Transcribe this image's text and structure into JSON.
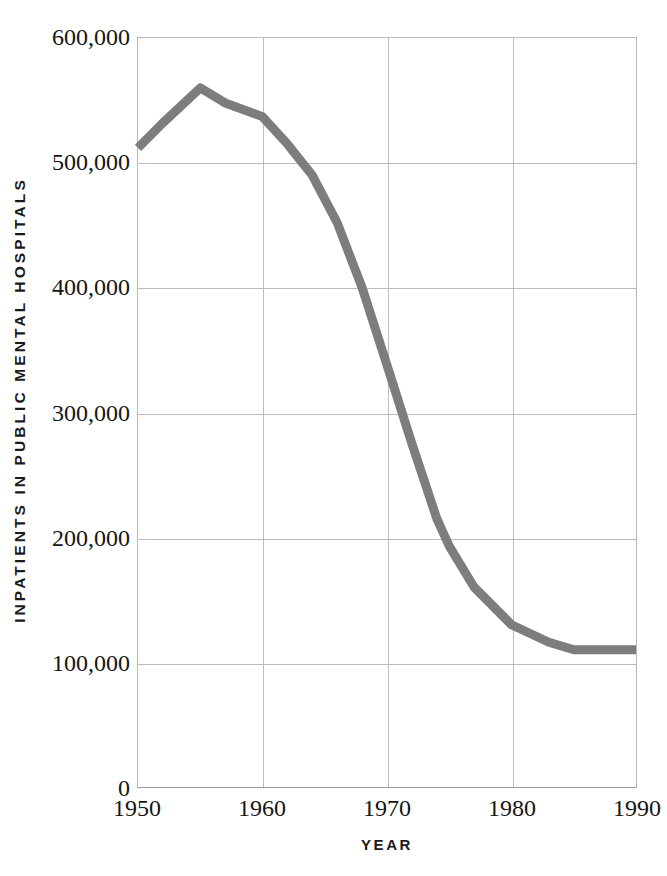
{
  "chart_data": {
    "type": "line",
    "title": "",
    "xlabel": "YEAR",
    "ylabel": "INPATIENTS IN PUBLIC MENTAL HOSPITALS",
    "xlim": [
      1950,
      1990
    ],
    "ylim": [
      0,
      600000
    ],
    "grid": true,
    "legend": false,
    "line_color": "#7d7d7d",
    "line_width": 9,
    "gridline_color": "#bcbcbc",
    "axis_color": "#9a9a9a",
    "background": "#ffffff",
    "x_ticks": [
      1950,
      1960,
      1970,
      1980,
      1990
    ],
    "x_tick_labels": [
      "1950",
      "1960",
      "1970",
      "1980",
      "1990"
    ],
    "y_ticks": [
      0,
      100000,
      200000,
      300000,
      400000,
      500000,
      600000
    ],
    "y_tick_labels": [
      "0",
      "100,000",
      "200,000",
      "300,000",
      "400,000",
      "500,000",
      "600,000"
    ],
    "x": [
      1950,
      1952,
      1955,
      1957,
      1960,
      1962,
      1964,
      1966,
      1968,
      1970,
      1972,
      1974,
      1975,
      1977,
      1980,
      1983,
      1985,
      1988,
      1990
    ],
    "values": [
      512000,
      532000,
      560000,
      548000,
      537000,
      515000,
      490000,
      452000,
      400000,
      338000,
      275000,
      215000,
      193000,
      160000,
      130000,
      116000,
      110000,
      110000,
      110000
    ],
    "series": [
      {
        "name": "Inpatients in public mental hospitals",
        "values": [
          512000,
          532000,
          560000,
          548000,
          537000,
          515000,
          490000,
          452000,
          400000,
          338000,
          275000,
          215000,
          193000,
          160000,
          130000,
          116000,
          110000,
          110000,
          110000
        ]
      }
    ]
  }
}
